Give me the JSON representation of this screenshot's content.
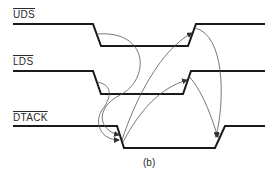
{
  "diagram": {
    "caption": "(b)",
    "signals": [
      {
        "name": "UDS",
        "active_low": true
      },
      {
        "name": "LDS",
        "active_low": true
      },
      {
        "name": "DTACK",
        "active_low": true
      }
    ],
    "line_color": "#1a1a1a",
    "arrow_color": "#555555"
  }
}
